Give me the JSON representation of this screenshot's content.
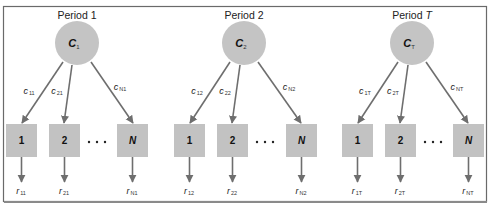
{
  "diagram": {
    "type": "tree-per-period",
    "periods": [
      {
        "title": "Period 1",
        "root": {
          "symbol": "C",
          "subscript": "1"
        },
        "edges": [
          {
            "symbol": "c",
            "subscript": "11"
          },
          {
            "symbol": "c",
            "subscript": "21"
          },
          {
            "symbol": "c",
            "subscript": "N1"
          }
        ],
        "leaves": [
          {
            "label": "1",
            "output": {
              "symbol": "r",
              "subscript": "11"
            }
          },
          {
            "label": "2",
            "output": {
              "symbol": "r",
              "subscript": "21"
            }
          },
          {
            "label": "N",
            "output": {
              "symbol": "r",
              "subscript": "N1"
            }
          }
        ],
        "ellipsis": "• • •"
      },
      {
        "title": "Period 2",
        "root": {
          "symbol": "C",
          "subscript": "2"
        },
        "edges": [
          {
            "symbol": "c",
            "subscript": "12"
          },
          {
            "symbol": "c",
            "subscript": "22"
          },
          {
            "symbol": "c",
            "subscript": "N2"
          }
        ],
        "leaves": [
          {
            "label": "1",
            "output": {
              "symbol": "r",
              "subscript": "12"
            }
          },
          {
            "label": "2",
            "output": {
              "symbol": "r",
              "subscript": "22"
            }
          },
          {
            "label": "N",
            "output": {
              "symbol": "r",
              "subscript": "N2"
            }
          }
        ],
        "ellipsis": "• • •"
      },
      {
        "title": "Period T",
        "title_prefix": "Period ",
        "title_var": "T",
        "root": {
          "symbol": "C",
          "subscript": "T"
        },
        "edges": [
          {
            "symbol": "c",
            "subscript": "1T"
          },
          {
            "symbol": "c",
            "subscript": "2T"
          },
          {
            "symbol": "c",
            "subscript": "NT"
          }
        ],
        "leaves": [
          {
            "label": "1",
            "output": {
              "symbol": "r",
              "subscript": "1T"
            }
          },
          {
            "label": "2",
            "output": {
              "symbol": "r",
              "subscript": "2T"
            }
          },
          {
            "label": "N",
            "output": {
              "symbol": "r",
              "subscript": "NT"
            }
          }
        ],
        "ellipsis": "• • •"
      }
    ],
    "colors": {
      "node_fill": "#c4c4c4",
      "edge": "#6e6e6e",
      "frame": "#6a6a6a"
    }
  }
}
